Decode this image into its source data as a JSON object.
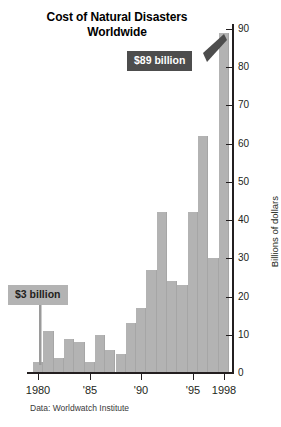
{
  "chart_data": {
    "type": "bar",
    "title": "Cost of Natural Disasters Worldwide",
    "title_lines": [
      "Cost of Natural Disasters",
      "Worldwide"
    ],
    "xlabel": "",
    "ylabel": "Billions of dollars",
    "ylim": [
      0,
      90
    ],
    "y_ticks": [
      0,
      10,
      20,
      30,
      40,
      50,
      60,
      70,
      80,
      90
    ],
    "y_tick_labels": [
      "0",
      "10",
      "20",
      "30",
      "40",
      "50",
      "60",
      "70",
      "80",
      "90"
    ],
    "grid": false,
    "legend": null,
    "bar_color": "#b3b3b3",
    "categories": [
      "1980",
      "1981",
      "1982",
      "1983",
      "1984",
      "1985",
      "1986",
      "1987",
      "1988",
      "1989",
      "1990",
      "1991",
      "1992",
      "1993",
      "1994",
      "1995",
      "1996",
      "1997",
      "1998"
    ],
    "values": [
      3,
      11,
      4,
      9,
      8,
      3,
      10,
      6,
      5,
      13,
      17,
      27,
      42,
      24,
      23,
      42,
      62,
      30,
      89
    ],
    "x_tick_labels": [
      {
        "label": "1980",
        "category": "1980"
      },
      {
        "label": "'85",
        "category": "1985"
      },
      {
        "label": "'90",
        "category": "1990"
      },
      {
        "label": "'95",
        "category": "1995"
      },
      {
        "label": "1998",
        "category": "1998"
      }
    ],
    "annotations": [
      {
        "name": "high-callout",
        "text": "$89 billion",
        "category": "1998",
        "value": 89,
        "style": "dark",
        "background": "#4d4d4d",
        "color": "#ffffff"
      },
      {
        "name": "low-callout",
        "text": "$3 billion",
        "category": "1980",
        "value": 3,
        "style": "light",
        "background": "#b3b3b3",
        "color": "#231f20"
      }
    ],
    "source": "Data: Worldwatch Institute"
  }
}
